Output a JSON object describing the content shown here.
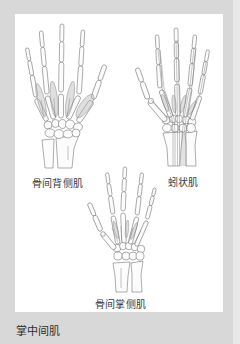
{
  "page": {
    "section_title": "掌中间肌"
  },
  "figure": {
    "labels": {
      "dorsal_interossei": "骨间背侧肌",
      "lumbricals": "蚓状肌",
      "palmar_interossei": "骨间掌侧肌"
    }
  },
  "colors": {
    "page_background": "#d8d8d8",
    "panel_background": "#ffffff",
    "text": "#333333",
    "line_art": "#6b6b6b"
  }
}
